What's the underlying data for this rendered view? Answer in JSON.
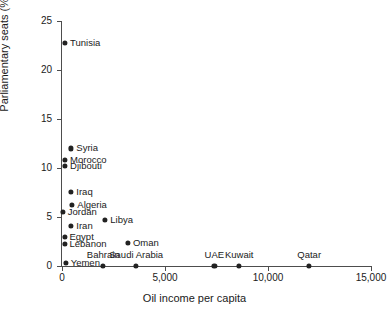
{
  "chart_data": {
    "type": "scatter",
    "title": "",
    "xlabel": "Oil income per capita",
    "ylabel": "Parliamentary seats (%)",
    "xlim": [
      0,
      15000
    ],
    "ylim": [
      0,
      25
    ],
    "xticks": [
      0,
      5000,
      10000,
      15000
    ],
    "xtick_labels": [
      "0",
      "5,000",
      "10,000",
      "15,000"
    ],
    "yticks": [
      0,
      5,
      10,
      15,
      20,
      25
    ],
    "ytick_labels": [
      "0",
      "5",
      "10",
      "15",
      "20",
      "25"
    ],
    "grid": false,
    "legend": false,
    "marker_color": "#222222",
    "axis_color": "#4d4d4d",
    "points": [
      {
        "label": "Tunisia",
        "x": 150,
        "y": 22.8,
        "label_pos": "right"
      },
      {
        "label": "Syria",
        "x": 450,
        "y": 12.0,
        "label_pos": "right"
      },
      {
        "label": "Morocco",
        "x": 150,
        "y": 10.8,
        "label_pos": "right"
      },
      {
        "label": "Djibouti",
        "x": 150,
        "y": 10.2,
        "label_pos": "right"
      },
      {
        "label": "Iraq",
        "x": 450,
        "y": 7.6,
        "label_pos": "right"
      },
      {
        "label": "Algeria",
        "x": 500,
        "y": 6.2,
        "label_pos": "right"
      },
      {
        "label": "Jordan",
        "x": 40,
        "y": 5.5,
        "label_pos": "right"
      },
      {
        "label": "Libya",
        "x": 2100,
        "y": 4.7,
        "label_pos": "right"
      },
      {
        "label": "Iran",
        "x": 450,
        "y": 4.1,
        "label_pos": "right"
      },
      {
        "label": "Egypt",
        "x": 120,
        "y": 3.0,
        "label_pos": "right"
      },
      {
        "label": "Oman",
        "x": 3200,
        "y": 2.4,
        "label_pos": "right"
      },
      {
        "label": "Lebanon",
        "x": 120,
        "y": 2.3,
        "label_pos": "right"
      },
      {
        "label": "Yemen",
        "x": 180,
        "y": 0.3,
        "label_pos": "right"
      },
      {
        "label": "Bahrain",
        "x": 2000,
        "y": 0.0,
        "label_pos": "above"
      },
      {
        "label": "Saudi Arabia",
        "x": 3600,
        "y": 0.0,
        "label_pos": "above"
      },
      {
        "label": "UAE",
        "x": 7400,
        "y": 0.0,
        "label_pos": "above"
      },
      {
        "label": "Kuwait",
        "x": 8600,
        "y": 0.0,
        "label_pos": "above"
      },
      {
        "label": "Qatar",
        "x": 12000,
        "y": 0.0,
        "label_pos": "above"
      }
    ]
  },
  "caption": ""
}
